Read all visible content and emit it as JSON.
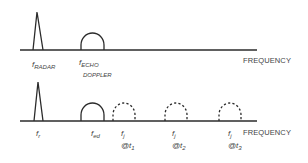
{
  "top_spectrum": {
    "axis_label": "FREQUENCY",
    "radar_label": {
      "base": "f",
      "sub": "RADAR"
    },
    "echo_label": {
      "base": "f",
      "sub": "ECHO",
      "line2": "DOPPLER"
    }
  },
  "bottom_spectrum": {
    "axis_label": "FREQUENCY",
    "labels": [
      {
        "base": "f",
        "sub": "r"
      },
      {
        "base": "f",
        "sub": "ed"
      },
      {
        "base": "f",
        "sub": "j",
        "time_prefix": "@t",
        "time_sub": "1"
      },
      {
        "base": "f",
        "sub": "j",
        "time_prefix": "@t",
        "time_sub": "2"
      },
      {
        "base": "f",
        "sub": "j",
        "time_prefix": "@t",
        "time_sub": "3"
      }
    ]
  },
  "colors": {
    "line": "#2b2b2b",
    "text": "#444444",
    "background": "#ffffff"
  }
}
